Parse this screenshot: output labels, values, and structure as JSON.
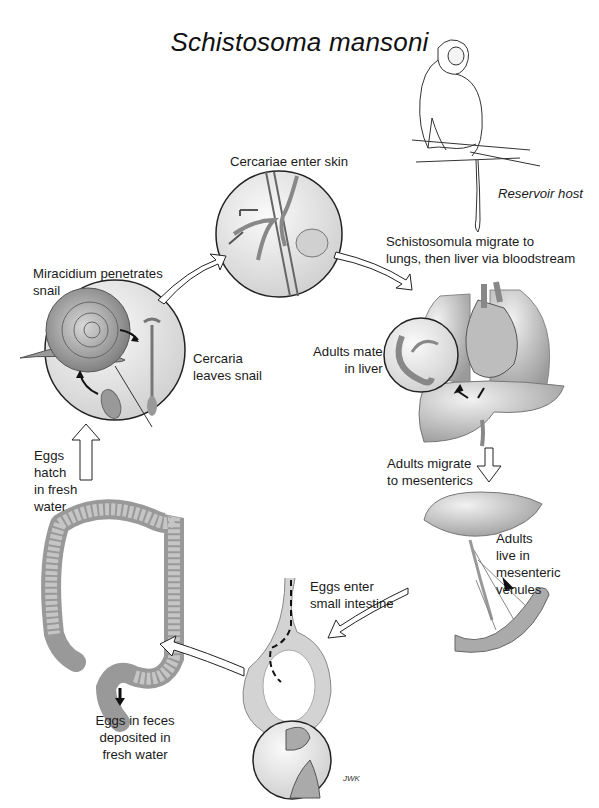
{
  "diagram": {
    "title": "Schistosoma mansoni",
    "type": "life-cycle",
    "labels": {
      "reservoir_host": "Reservoir host",
      "cercariae_enter_skin": "Cercariae enter skin",
      "schistosomula_line1": "Schistosomula migrate to",
      "schistosomula_line2": "lungs, then liver via bloodstream",
      "miracidium_line1": "Miracidium penetrates",
      "miracidium_line2": "snail",
      "cercaria_leaves_line1": "Cercaria",
      "cercaria_leaves_line2": "leaves snail",
      "adults_mate_line1": "Adults mate",
      "adults_mate_line2": "in liver",
      "eggs_hatch_line1": "Eggs",
      "eggs_hatch_line2": "hatch",
      "eggs_hatch_line3": "in fresh",
      "eggs_hatch_line4": "water",
      "adults_migrate_line1": "Adults migrate",
      "adults_migrate_line2": "to mesenterics",
      "adults_live_line1": "Adults",
      "adults_live_line2": "live in",
      "adults_live_line3": "mesenteric",
      "adults_live_line4": "venules",
      "eggs_enter_line1": "Eggs enter",
      "eggs_enter_line2": "small intestine",
      "eggs_feces_line1": "Eggs in feces",
      "eggs_feces_line2": "deposited in",
      "eggs_feces_line3": "fresh water",
      "signature": "JWK"
    },
    "stages": [
      {
        "id": "snail",
        "illustration": "snail-with-miracidium-and-cercaria"
      },
      {
        "id": "skin",
        "illustration": "cercariae-penetrating-skin"
      },
      {
        "id": "lungs-liver",
        "illustration": "lungs-heart-liver"
      },
      {
        "id": "mesenterics",
        "illustration": "liver-mesenteric-venules"
      },
      {
        "id": "small-intestine",
        "illustration": "intestine-cross-section"
      },
      {
        "id": "colon",
        "illustration": "large-intestine"
      }
    ],
    "colors": {
      "line": "#1a1a1a",
      "organ_fill": "#c9c9c9",
      "circle_fill": "#ececec"
    }
  }
}
